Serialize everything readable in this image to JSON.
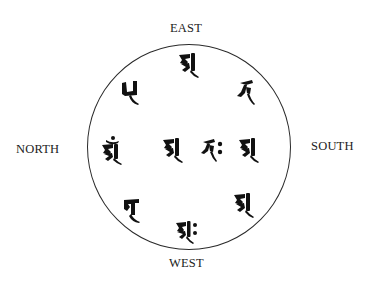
{
  "diagram": {
    "title": "",
    "directions": {
      "east": "EAST",
      "west": "WEST",
      "north": "NORTH",
      "south": "SOUTH"
    },
    "colors": {
      "ink": "#111111",
      "circle": "#2a2a2a",
      "background": "#ffffff"
    },
    "glyphs": [
      {
        "id": "top",
        "position": "east",
        "icon": "siddham-syllable-a-icon"
      },
      {
        "id": "top-left",
        "position": "northeast",
        "icon": "siddham-syllable-icon"
      },
      {
        "id": "top-right",
        "position": "southeast",
        "icon": "siddham-syllable-icon"
      },
      {
        "id": "left",
        "position": "north",
        "icon": "siddham-syllable-am-icon"
      },
      {
        "id": "center-left",
        "position": "center",
        "icon": "siddham-syllable-a-icon"
      },
      {
        "id": "center-right",
        "position": "center",
        "icon": "siddham-syllable-ah-icon"
      },
      {
        "id": "right",
        "position": "south",
        "icon": "siddham-syllable-a-icon"
      },
      {
        "id": "bottom-left",
        "position": "northwest",
        "icon": "siddham-syllable-icon"
      },
      {
        "id": "bottom",
        "position": "west",
        "icon": "siddham-syllable-ah-icon"
      },
      {
        "id": "bottom-right",
        "position": "southwest",
        "icon": "siddham-syllable-a-icon"
      }
    ]
  }
}
